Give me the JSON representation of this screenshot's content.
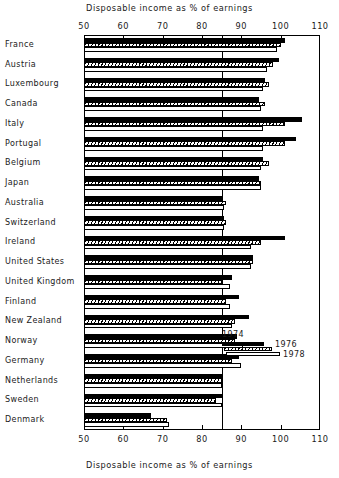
{
  "chart_data": {
    "type": "bar",
    "orientation": "horizontal",
    "title": "Disposable income as % of earnings",
    "subtitle": "Disposable income as % of earnings",
    "xlabel": "Disposable income as % of earnings",
    "ylabel": "",
    "xlim": [
      50,
      110
    ],
    "xticks": [
      50,
      60,
      70,
      80,
      90,
      100,
      110
    ],
    "xticklabels": [
      "50",
      "60",
      "70",
      "80",
      "90",
      "100",
      "110"
    ],
    "grid": false,
    "reference_line": 85,
    "legend_position": "middle-right",
    "legend_entries": [
      "1974",
      "1976",
      "1978"
    ],
    "categories": [
      "France",
      "Austria",
      "Luxembourg",
      "Canada",
      "Italy",
      "Portugal",
      "Belgium",
      "Japan",
      "Australia",
      "Switzerland",
      "Ireland",
      "United States",
      "United Kingdom",
      "Finland",
      "New Zealand",
      "Norway",
      "Germany",
      "Netherlands",
      "Sweden",
      "Denmark"
    ],
    "series": [
      {
        "name": "1974",
        "color": "#000000",
        "values": [
          101.0,
          99.5,
          96.0,
          94.5,
          105.5,
          104.0,
          95.5,
          94.5,
          85.0,
          85.5,
          101.0,
          93.0,
          87.5,
          89.5,
          92.0,
          89.0,
          89.5,
          85.0,
          85.0,
          67.0
        ]
      },
      {
        "name": "1976",
        "color": "#ffffff",
        "hatch": "diagonal",
        "values": [
          100.0,
          98.0,
          97.0,
          96.0,
          101.0,
          101.0,
          97.0,
          95.0,
          86.0,
          86.0,
          95.0,
          93.0,
          85.0,
          86.0,
          88.5,
          88.5,
          87.5,
          85.0,
          83.5,
          71.0
        ]
      },
      {
        "name": "1978",
        "color": "#ffffff",
        "values": [
          99.0,
          96.5,
          95.5,
          95.0,
          95.5,
          95.5,
          95.0,
          95.0,
          85.5,
          85.5,
          92.5,
          92.5,
          87.0,
          87.0,
          87.5,
          90.5,
          90.0,
          85.0,
          85.0,
          71.5
        ]
      }
    ]
  }
}
